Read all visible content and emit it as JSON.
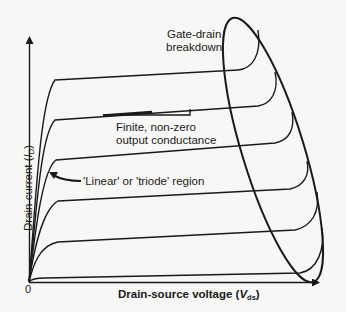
{
  "diagram": {
    "axes": {
      "x_label_prefix": "Drain-source voltage (",
      "x_label_var": "V",
      "x_label_sub": "ds",
      "x_label_suffix": ")",
      "y_label_prefix": "Drain current (",
      "y_label_var": "I",
      "y_label_sub": "D",
      "y_label_suffix": ")",
      "origin": "0"
    },
    "annotations": {
      "gate_drain_line1": "Gate-drain",
      "gate_drain_line2": "breakdown",
      "finite_line1": "Finite, non-zero",
      "finite_line2": "output conductance",
      "linear_region": "'Linear' or 'triode' region"
    },
    "curves_count": 6,
    "colors": {
      "line": "#1a1a1a",
      "background": "#f7f7f5"
    }
  }
}
